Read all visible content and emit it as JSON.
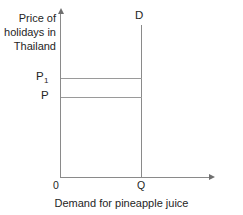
{
  "figure": {
    "width": 243,
    "height": 215,
    "background_color": "#ffffff",
    "line_color": "#8a8a8a",
    "text_color": "#252525"
  },
  "axes": {
    "y_axis_label": "Price of\nholidays in\nThailand",
    "x_axis_caption": "Demand for pineapple juice",
    "origin_label": "0",
    "y_arrow_icon": "arrow-up-icon",
    "x_arrow_icon": "arrow-right-icon"
  },
  "labels": {
    "price_high_base": "P",
    "price_high_subscript": "1",
    "price_low": "P",
    "quantity": "Q",
    "demand_curve": "D"
  },
  "chart_data": {
    "type": "line",
    "title": "",
    "subtitle": "",
    "xlabel": "Demand for pineapple juice",
    "ylabel": "Price of holidays in Thailand",
    "grid": false,
    "legend": "none",
    "xlim": [
      0,
      1
    ],
    "ylim": [
      0,
      1
    ],
    "x_ticks": [
      {
        "label": "0",
        "value": 0
      },
      {
        "label": "Q",
        "value": 0.54
      }
    ],
    "y_ticks": [
      {
        "label": "P",
        "value": 0.48
      },
      {
        "label": "P1",
        "value": 0.6
      }
    ],
    "series": [
      {
        "name": "D",
        "annotation": "D",
        "description": "Perfectly inelastic vertical demand curve at quantity Q",
        "x": [
          0.54,
          0.54
        ],
        "y": [
          0.0,
          1.0
        ]
      },
      {
        "name": "P price line",
        "description": "Horizontal guide line from price P to the demand curve",
        "x": [
          0.0,
          0.54
        ],
        "y": [
          0.48,
          0.48
        ]
      },
      {
        "name": "P1 price line",
        "description": "Horizontal guide line from price P1 to the demand curve",
        "x": [
          0.0,
          0.54
        ],
        "y": [
          0.6,
          0.6
        ]
      }
    ]
  }
}
